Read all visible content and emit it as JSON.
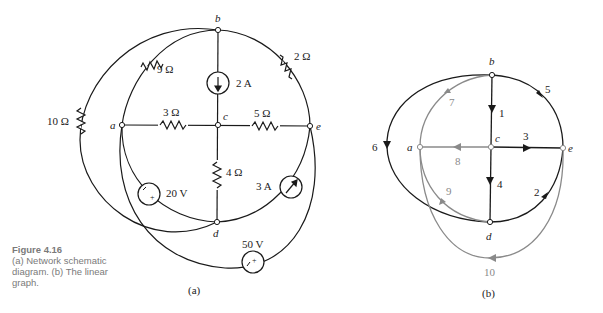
{
  "caption": {
    "figure": "Figure 4.16",
    "text": "(a) Network schematic diagram. (b) The linear graph."
  },
  "schematic": {
    "sublabel": "(a)",
    "nodes": {
      "a": "a",
      "b": "b",
      "c": "c",
      "d": "d",
      "e": "e"
    },
    "elements": {
      "r9": "9 Ω",
      "r2": "2 Ω",
      "r10": "10 Ω",
      "r3": "3 Ω",
      "r5": "5 Ω",
      "r4": "4 Ω",
      "i2": "2 A",
      "i3": "3 A",
      "v20": "20 V",
      "v50": "50 V"
    }
  },
  "graph": {
    "sublabel": "(b)",
    "nodes": {
      "a": "a",
      "b": "b",
      "c": "c",
      "d": "d",
      "e": "e"
    },
    "branches": {
      "b1": "1",
      "b2": "2",
      "b3": "3",
      "b4": "4",
      "b5": "5",
      "b6": "6",
      "b7": "7",
      "b8": "8",
      "b9": "9",
      "b10": "10"
    },
    "colors": {
      "tree": "#1a1a1a",
      "link": "#8a8a8a"
    }
  }
}
